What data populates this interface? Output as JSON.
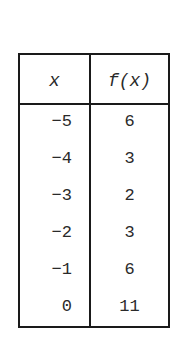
{
  "table": {
    "headers": {
      "x": "x",
      "fx": "f(x)"
    },
    "rows": [
      {
        "x": "−5",
        "fx": "6"
      },
      {
        "x": "−4",
        "fx": "3"
      },
      {
        "x": "−3",
        "fx": "2"
      },
      {
        "x": "−2",
        "fx": "3"
      },
      {
        "x": "−1",
        "fx": "6"
      },
      {
        "x": "0",
        "fx": "11"
      }
    ]
  }
}
